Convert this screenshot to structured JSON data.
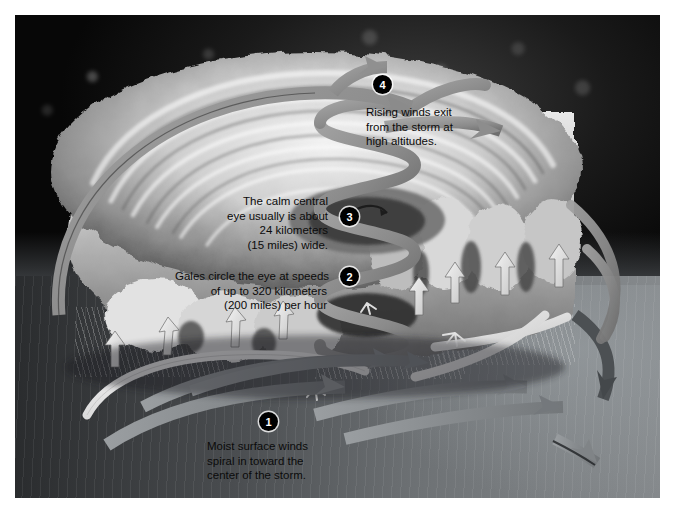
{
  "figure": {
    "border_color": "#ffffff",
    "background_color": "#0a0a0a"
  },
  "palette": {
    "arrow_gray": "#8d8d8d",
    "arrow_gray_dark": "#6a6a6a",
    "arrow_white": "#e9e9e9",
    "cloud_light": "#e6e6e6",
    "cloud_mid": "#b9b9b9",
    "cloud_dark": "#5d5d5d",
    "sea_near": "#85898c",
    "sea_far": "#2a2c2e",
    "sky": "#0a0a0a",
    "badge_fill": "#000000",
    "badge_text": "#ffffff",
    "label_text": "#0b0b0b"
  },
  "callouts": [
    {
      "number": "1",
      "align": "left",
      "lines": [
        "Moist surface winds",
        "spiral in  toward the",
        "center of the storm."
      ]
    },
    {
      "number": "2",
      "align": "right",
      "lines": [
        "Gales circle the eye at speeds",
        "of up to  320 kilometers",
        "(200 miles) per hour"
      ]
    },
    {
      "number": "3",
      "align": "right",
      "lines": [
        "The calm central",
        "eye usually is about",
        "24 kilometers",
        "(15 miles) wide."
      ]
    },
    {
      "number": "4",
      "align": "left",
      "lines": [
        "Rising winds exit",
        "from the  storm at",
        "high altitudes."
      ]
    }
  ],
  "icons": {
    "inflow_arrow": "curved-arrow-icon",
    "updraft_arrow": "up-arrow-icon",
    "outflow_arrow": "curved-arrow-icon",
    "eye_helix": "spiral-ribbon-icon"
  }
}
